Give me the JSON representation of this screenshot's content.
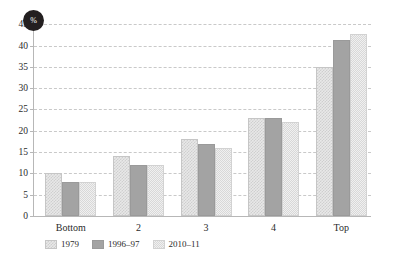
{
  "badge": {
    "label": "%"
  },
  "chart_data": {
    "type": "bar",
    "title": "",
    "subtitle": "",
    "xlabel": "",
    "ylabel": "%",
    "ylim": [
      0,
      46
    ],
    "yticks": [
      0,
      5,
      10,
      15,
      20,
      25,
      30,
      35,
      40,
      45
    ],
    "grid": true,
    "legend_position": "bottom-left",
    "categories": [
      "Bottom",
      "2",
      "3",
      "4",
      "Top"
    ],
    "series": [
      {
        "name": "1979",
        "color": "#e8e8e8",
        "pattern": "checker-coarse",
        "values": [
          10,
          14,
          18,
          23,
          35
        ]
      },
      {
        "name": "1996–97",
        "color": "#a3a3a3",
        "pattern": "solid",
        "values": [
          8,
          12,
          17,
          23,
          41.3
        ]
      },
      {
        "name": "2010–11",
        "color": "#f0f0f0",
        "pattern": "checker-fine",
        "values": [
          8,
          12,
          16,
          22,
          42.7
        ]
      }
    ]
  }
}
